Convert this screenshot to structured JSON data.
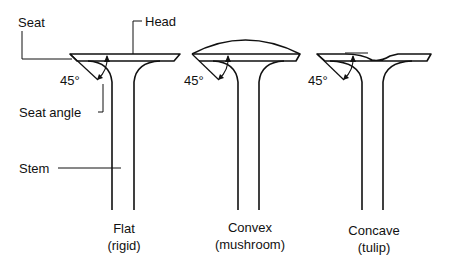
{
  "labels": {
    "seat": "Seat",
    "head": "Head",
    "seat_angle": "Seat angle",
    "stem": "Stem"
  },
  "valves": [
    {
      "name": "Flat",
      "sub": "(rigid)",
      "angle": "45°"
    },
    {
      "name": "Convex",
      "sub": "(mushroom)",
      "angle": "45°"
    },
    {
      "name": "Concave",
      "sub": "(tulip)",
      "angle": "45°"
    }
  ]
}
